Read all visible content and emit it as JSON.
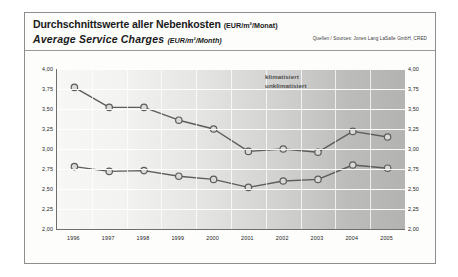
{
  "figure": {
    "title_de": "Durchschnittswerte aller Nebenkosten",
    "title_de_unit": "(EUR/m²/Monat)",
    "title_en": "Average Service Charges",
    "title_en_unit": "(EUR/m²/Month)",
    "source": "Quellen / Sources: Jones Lang LaSalle GmbH, CRED"
  },
  "colors": {
    "marker_fill": "#d9d9d6",
    "marker_stroke": "#5c5c5c",
    "line": "#5c5c5c",
    "axis": "#6e6e6e",
    "grid": "#ffffff",
    "text": "#1a1a1a",
    "legend_text": "#4d4d4d",
    "frame": "#8d8d8d"
  },
  "chart_data": {
    "type": "line",
    "xlabel": "",
    "ylabel": "",
    "ylim": [
      2.0,
      4.0
    ],
    "ystep": 0.25,
    "grid": true,
    "legend_position": "inside-top-right",
    "yticks": [
      "4,00",
      "3,75",
      "3,50",
      "3,25",
      "3,00",
      "2,75",
      "2,50",
      "2,25",
      "2,00"
    ],
    "ytick_values": [
      4.0,
      3.75,
      3.5,
      3.25,
      3.0,
      2.75,
      2.5,
      2.25,
      2.0
    ],
    "categories": [
      "1996",
      "1997",
      "1998",
      "1999",
      "2000",
      "2001",
      "2002",
      "2003",
      "2004",
      "2005"
    ],
    "series": [
      {
        "name": "klimatisiert",
        "values": [
          3.77,
          3.52,
          3.52,
          3.36,
          3.25,
          2.97,
          3.0,
          2.96,
          3.22,
          3.15
        ]
      },
      {
        "name": "unklimatisiert",
        "values": [
          2.78,
          2.72,
          2.73,
          2.66,
          2.62,
          2.52,
          2.6,
          2.62,
          2.8,
          2.76
        ]
      }
    ]
  }
}
